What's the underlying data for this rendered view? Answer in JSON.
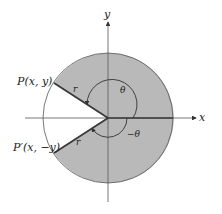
{
  "diagram": {
    "type": "unit-circle-angle-reflection",
    "axes": {
      "x_label": "x",
      "y_label": "y"
    },
    "points": {
      "P": {
        "label": "P(x, y)"
      },
      "P_prime": {
        "label": "P′(x, −y)"
      }
    },
    "radius_labels": {
      "upper": "r",
      "lower": "r"
    },
    "angles": {
      "positive": "θ",
      "negative": "−θ"
    },
    "colors": {
      "disk_fill": "#b9b9b9",
      "stroke": "#444444",
      "radius_stroke": "#3a3a3a",
      "background": "#ffffff"
    }
  }
}
